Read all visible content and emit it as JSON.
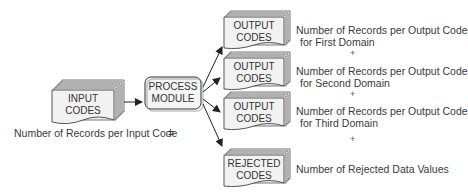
{
  "input": {
    "line1": "INPUT",
    "line2": "CODES"
  },
  "process": {
    "line1": "PROCESS",
    "line2": "MODULE"
  },
  "outputs": [
    {
      "line1": "OUTPUT",
      "line2": "CODES",
      "desc1": "Number of Records per Output Code",
      "desc2": "for First Domain"
    },
    {
      "line1": "OUTPUT",
      "line2": "CODES",
      "desc1": "Number of Records per Output Code",
      "desc2": "for Second Domain"
    },
    {
      "line1": "OUTPUT",
      "line2": "CODES",
      "desc1": "Number of Records per Output Code",
      "desc2": "for Third Domain"
    },
    {
      "line1": "REJECTED",
      "line2": "CODES",
      "desc1": "Number of Rejected Data Values",
      "desc2": ""
    }
  ],
  "equation": {
    "left": "Number of Records per Input Code",
    "equals": "=",
    "plus": "+"
  }
}
